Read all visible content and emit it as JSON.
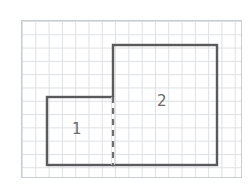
{
  "figure": {
    "canvas": {
      "width": 251,
      "height": 193,
      "background": "#ffffff"
    }
  },
  "grid": {
    "name": "square-grid-paper",
    "left": 21,
    "top": 20,
    "width": 221,
    "height": 158,
    "cell_size": 13.3,
    "columns": 17,
    "rows": 12,
    "line_color": "#dcdfe3",
    "border_color": "#c9ced3"
  },
  "style": {
    "outline_color": "#5a5a5a",
    "outline_width": 2.4,
    "dash_color": "#6e6e6e",
    "dash_width": 2.2,
    "dash_pattern": "6 5",
    "label_color": "#6b6b6b"
  },
  "shapes": [
    {
      "name": "rectangle-1",
      "label": "1",
      "x": 47,
      "y": 97,
      "width": 66,
      "height": 68,
      "cells_wide": 5,
      "cells_tall": 5
    },
    {
      "name": "rectangle-2",
      "label": "2",
      "x": 113,
      "y": 45,
      "width": 104,
      "height": 120,
      "cells_wide": 8,
      "cells_tall": 9
    }
  ],
  "divider": {
    "name": "shared-edge-dashed",
    "x": 113,
    "y1": 97,
    "y2": 165,
    "style": "dashed"
  },
  "labels": {
    "region_one": "1",
    "region_two": "2"
  }
}
